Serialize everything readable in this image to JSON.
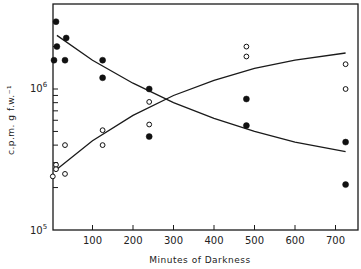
{
  "chart_data": {
    "type": "scatter",
    "title": "",
    "xlabel": "Minutes of Darkness",
    "ylabel": "c.p.m. g f.w.⁻¹",
    "xlim": [
      0,
      740
    ],
    "ylim": [
      100000,
      4000000
    ],
    "yscale": "log",
    "x_ticks": [
      100,
      200,
      300,
      400,
      500,
      600,
      700
    ],
    "y_tick_labels": [
      "10⁵",
      "10⁶"
    ],
    "grid": false,
    "legend": null,
    "series": [
      {
        "name": "filled circles",
        "marker": "filled-circle",
        "points": [
          [
            10,
            3000000
          ],
          [
            12,
            2000000
          ],
          [
            5,
            1600000
          ],
          [
            35,
            2300000
          ],
          [
            32,
            1600000
          ],
          [
            125,
            1600000
          ],
          [
            125,
            1200000
          ],
          [
            240,
            1000000
          ],
          [
            240,
            460000
          ],
          [
            480,
            850000
          ],
          [
            480,
            550000
          ],
          [
            725,
            420000
          ],
          [
            725,
            210000
          ]
        ],
        "fit_curve": [
          [
            12,
            2400000
          ],
          [
            100,
            1600000
          ],
          [
            200,
            1100000
          ],
          [
            300,
            800000
          ],
          [
            400,
            620000
          ],
          [
            500,
            500000
          ],
          [
            600,
            420000
          ],
          [
            725,
            360000
          ]
        ]
      },
      {
        "name": "open circles",
        "marker": "open-circle",
        "points": [
          [
            2,
            240000
          ],
          [
            10,
            290000
          ],
          [
            10,
            270000
          ],
          [
            32,
            400000
          ],
          [
            32,
            250000
          ],
          [
            125,
            510000
          ],
          [
            125,
            400000
          ],
          [
            240,
            810000
          ],
          [
            240,
            560000
          ],
          [
            480,
            2000000
          ],
          [
            480,
            1700000
          ],
          [
            725,
            1500000
          ],
          [
            725,
            1000000
          ]
        ],
        "fit_curve": [
          [
            12,
            270000
          ],
          [
            100,
            430000
          ],
          [
            200,
            650000
          ],
          [
            300,
            900000
          ],
          [
            400,
            1150000
          ],
          [
            500,
            1400000
          ],
          [
            600,
            1600000
          ],
          [
            725,
            1800000
          ]
        ]
      }
    ]
  },
  "axes": {
    "x_label": "Minutes of Darkness",
    "y_label": "c.p.m. g f.w.⁻¹",
    "x_tick_labels": [
      "100",
      "200",
      "300",
      "400",
      "500",
      "600",
      "700"
    ],
    "y_major_labels": [
      "10⁶",
      "10⁵"
    ]
  }
}
